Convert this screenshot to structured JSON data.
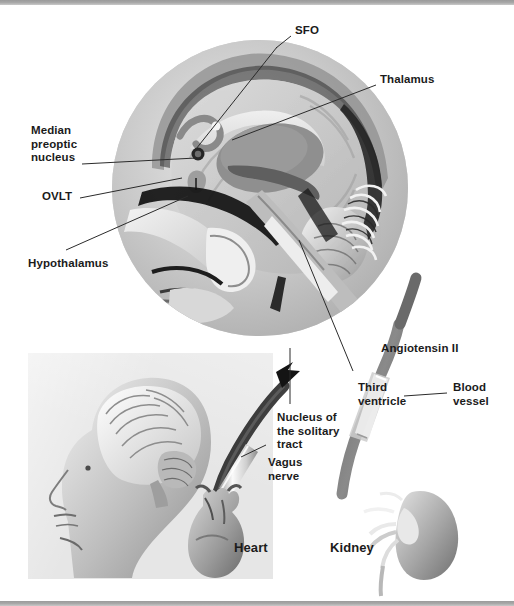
{
  "figure": {
    "background_color": "#ffffff",
    "rule_color": "#9a9a9a",
    "panel_color": "#e6e6e6",
    "label_color": "#1b1b1b"
  },
  "labels": {
    "sfo": "SFO",
    "thalamus": "Thalamus",
    "median_preoptic_nucleus": "Median\npreoptic\nnucleus",
    "ovlt": "OVLT",
    "hypothalamus": "Hypothalamus",
    "angiotensin_ii": "Angiotensin II",
    "third_ventricle": "Third\nventricle",
    "blood_vessel": "Blood\nvessel",
    "nucleus_of_the_solitary_tract": "Nucleus of\nthe solitary\ntract",
    "vagus_nerve": "Vagus\nnerve",
    "heart": "Heart",
    "kidney": "Kidney"
  },
  "structures": {
    "mri_sagittal_head": "mid-sagittal MRI of the head",
    "head_with_brain": "lateral view of human head showing brain",
    "heart_organ": "heart",
    "kidney_organ": "kidney",
    "blood_vessel_segment": "blood vessel carrying angiotensin II",
    "vagus_nerve_trunk": "vagus nerve from heart to brainstem"
  }
}
